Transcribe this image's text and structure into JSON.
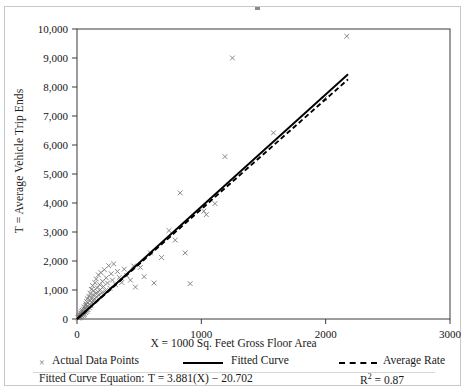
{
  "chart_data": {
    "type": "scatter",
    "title": "",
    "xlabel": "X = 1000 Sq. Feet Gross Floor Area",
    "ylabel": "T = Average Vehicle Trip Ends",
    "xlim": [
      0,
      3000
    ],
    "ylim": [
      0,
      10000
    ],
    "xticks": [
      "0",
      "1000",
      "2000",
      "3000"
    ],
    "xtick_values": [
      0,
      1000,
      2000,
      3000
    ],
    "yticks": [
      "0",
      "1,000",
      "2,000",
      "3,000",
      "4,000",
      "5,000",
      "6,000",
      "7,000",
      "8,000",
      "9,000",
      "10,000"
    ],
    "ytick_values": [
      0,
      1000,
      2000,
      3000,
      4000,
      5000,
      6000,
      7000,
      8000,
      9000,
      10000
    ],
    "grid": false,
    "legend_position": "below-axis",
    "series": [
      {
        "name": "Actual Data Points",
        "type": "scatter",
        "marker": "x",
        "color": "#7a7a7a",
        "points": [
          [
            8,
            40
          ],
          [
            12,
            70
          ],
          [
            15,
            35
          ],
          [
            18,
            110
          ],
          [
            20,
            60
          ],
          [
            22,
            150
          ],
          [
            25,
            95
          ],
          [
            28,
            180
          ],
          [
            30,
            55
          ],
          [
            32,
            210
          ],
          [
            35,
            130
          ],
          [
            38,
            260
          ],
          [
            40,
            90
          ],
          [
            42,
            300
          ],
          [
            45,
            170
          ],
          [
            48,
            230
          ],
          [
            50,
            120
          ],
          [
            52,
            340
          ],
          [
            55,
            200
          ],
          [
            58,
            420
          ],
          [
            60,
            150
          ],
          [
            62,
            380
          ],
          [
            65,
            280
          ],
          [
            68,
            460
          ],
          [
            70,
            220
          ],
          [
            72,
            520
          ],
          [
            75,
            330
          ],
          [
            78,
            600
          ],
          [
            80,
            260
          ],
          [
            82,
            700
          ],
          [
            85,
            430
          ],
          [
            88,
            560
          ],
          [
            90,
            320
          ],
          [
            95,
            780
          ],
          [
            98,
            500
          ],
          [
            100,
            390
          ],
          [
            105,
            880
          ],
          [
            108,
            640
          ],
          [
            112,
            460
          ],
          [
            115,
            1020
          ],
          [
            118,
            730
          ],
          [
            120,
            560
          ],
          [
            125,
            1150
          ],
          [
            128,
            840
          ],
          [
            132,
            620
          ],
          [
            135,
            980
          ],
          [
            140,
            700
          ],
          [
            145,
            1250
          ],
          [
            150,
            880
          ],
          [
            155,
            1380
          ],
          [
            158,
            760
          ],
          [
            162,
            1080
          ],
          [
            168,
            940
          ],
          [
            172,
            1520
          ],
          [
            178,
            820
          ],
          [
            182,
            1180
          ],
          [
            188,
            1010
          ],
          [
            192,
            1600
          ],
          [
            198,
            900
          ],
          [
            205,
            1300
          ],
          [
            212,
            1120
          ],
          [
            220,
            1700
          ],
          [
            228,
            980
          ],
          [
            235,
            1420
          ],
          [
            245,
            1240
          ],
          [
            255,
            1840
          ],
          [
            265,
            1060
          ],
          [
            275,
            1560
          ],
          [
            285,
            1340
          ],
          [
            295,
            1900
          ],
          [
            310,
            1180
          ],
          [
            325,
            1640
          ],
          [
            340,
            1430
          ],
          [
            360,
            1260
          ],
          [
            380,
            1720
          ],
          [
            400,
            1500
          ],
          [
            430,
            1340
          ],
          [
            455,
            1830
          ],
          [
            470,
            1100
          ],
          [
            510,
            1780
          ],
          [
            540,
            1460
          ],
          [
            590,
            2280
          ],
          [
            620,
            1240
          ],
          [
            680,
            2120
          ],
          [
            740,
            3050
          ],
          [
            790,
            2720
          ],
          [
            830,
            4350
          ],
          [
            870,
            2280
          ],
          [
            910,
            1220
          ],
          [
            1020,
            3720
          ],
          [
            1040,
            3600
          ],
          [
            1110,
            3980
          ],
          [
            1190,
            5600
          ],
          [
            1250,
            9000
          ],
          [
            1580,
            6420
          ],
          [
            1990,
            7600
          ],
          [
            2170,
            9750
          ]
        ]
      },
      {
        "name": "Fitted Curve",
        "type": "line",
        "style": "solid",
        "color": "#000000",
        "equation": "T = 3.881(X) − 20.702",
        "slope": 3.881,
        "intercept": -20.702,
        "x_range": [
          0,
          2180
        ]
      },
      {
        "name": "Average Rate",
        "type": "line",
        "style": "dashed",
        "color": "#000000",
        "slope": 3.79,
        "intercept": 0,
        "x_range": [
          0,
          2180
        ]
      }
    ]
  },
  "legend": {
    "items": [
      {
        "label": "Actual Data Points",
        "marker": "x-marker"
      },
      {
        "label": "Fitted Curve",
        "marker": "solid-line"
      },
      {
        "label": "Average Rate",
        "marker": "dashed-line"
      }
    ],
    "equation_label": "Fitted Curve Equation:",
    "equation_value": "T = 3.881(X) − 20.702",
    "r_squared_prefix": "R",
    "r_squared_sup": "2",
    "r_squared_value": "= 0.87"
  }
}
